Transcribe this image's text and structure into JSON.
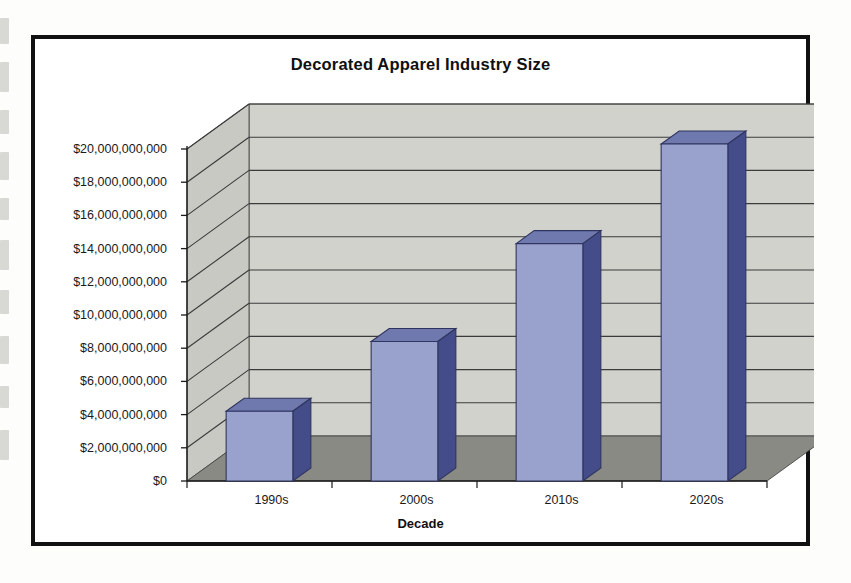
{
  "page": {
    "background_color": "#fdfdfc",
    "frame_color": "#111111"
  },
  "chart_data": {
    "type": "bar",
    "title": "Decorated Apparel Industry Size",
    "xlabel": "Decade",
    "ylabel": "",
    "categories": [
      "1990s",
      "2000s",
      "2010s",
      "2020s"
    ],
    "values": [
      4200000000,
      8400000000,
      14300000000,
      20300000000
    ],
    "ylim": [
      0,
      20000000000
    ],
    "ytick_values": [
      0,
      2000000000,
      4000000000,
      6000000000,
      8000000000,
      10000000000,
      12000000000,
      14000000000,
      16000000000,
      18000000000,
      20000000000
    ],
    "ytick_labels": [
      "$0",
      "$2,000,000,000",
      "$4,000,000,000",
      "$6,000,000,000",
      "$8,000,000,000",
      "$10,000,000,000",
      "$12,000,000,000",
      "$14,000,000,000",
      "$16,000,000,000",
      "$18,000,000,000",
      "$20,000,000,000"
    ],
    "grid": true,
    "legend": false,
    "style": "3d-column",
    "colors": {
      "bar_front": "#99a2cc",
      "bar_top": "#6f79ad",
      "bar_side": "#444d8a",
      "bar_outline": "#2f355f",
      "back_wall": "#d2d2cd",
      "side_wall": "#c9c9c4",
      "floor": "#8a8a85",
      "gridline": "#3b3b3b",
      "axis": "#1a1a1a"
    }
  }
}
